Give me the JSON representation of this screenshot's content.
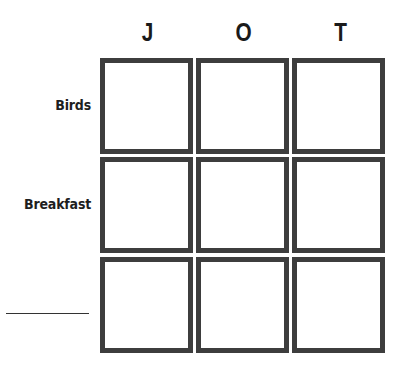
{
  "puzzle": {
    "columns": [
      {
        "letter": "J"
      },
      {
        "letter": "O"
      },
      {
        "letter": "T"
      }
    ],
    "rows": [
      {
        "label": "Birds"
      },
      {
        "label": "Breakfast"
      },
      {
        "label": ""
      }
    ],
    "cells": [
      [
        "",
        "",
        ""
      ],
      [
        "",
        "",
        ""
      ],
      [
        "",
        "",
        ""
      ]
    ]
  }
}
